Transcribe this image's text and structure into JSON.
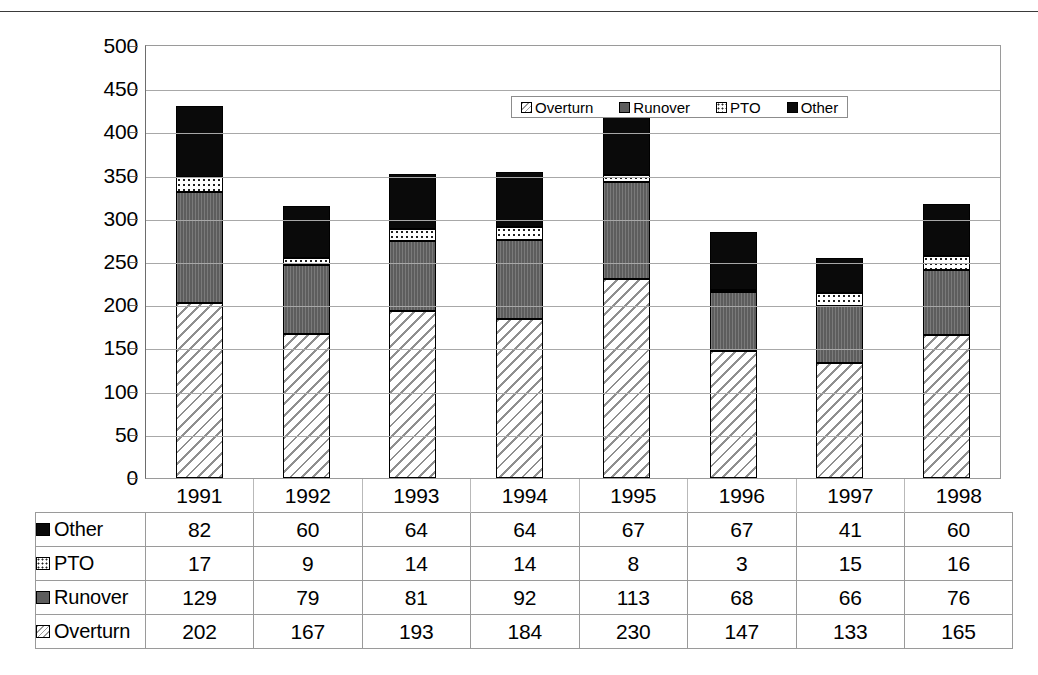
{
  "chart_data": {
    "type": "bar",
    "stacked": true,
    "title": "",
    "xlabel": "",
    "ylabel": "",
    "ylim": [
      0,
      500
    ],
    "ytick_step": 50,
    "yticks": [
      500,
      450,
      400,
      350,
      300,
      250,
      200,
      150,
      100,
      50,
      0
    ],
    "grid": true,
    "legend_position": "top-center",
    "categories": [
      "1991",
      "1992",
      "1993",
      "1994",
      "1995",
      "1996",
      "1997",
      "1998"
    ],
    "series": [
      {
        "name": "Overturn",
        "pattern": "diagonal-hatch",
        "values": [
          202,
          167,
          193,
          184,
          230,
          147,
          133,
          165
        ]
      },
      {
        "name": "Runover",
        "pattern": "solid-gray",
        "values": [
          129,
          79,
          81,
          92,
          113,
          68,
          66,
          76
        ]
      },
      {
        "name": "PTO",
        "pattern": "dotted-white",
        "values": [
          17,
          9,
          14,
          14,
          8,
          3,
          15,
          16
        ]
      },
      {
        "name": "Other",
        "pattern": "solid-black",
        "values": [
          82,
          60,
          64,
          64,
          67,
          67,
          41,
          60
        ]
      }
    ],
    "stack_order_bottom_to_top": [
      "Overturn",
      "Runover",
      "PTO",
      "Other"
    ]
  },
  "legend": {
    "items": [
      {
        "label": "Overturn",
        "swatch": "overturn"
      },
      {
        "label": "Runover",
        "swatch": "runover"
      },
      {
        "label": "PTO",
        "swatch": "pto"
      },
      {
        "label": "Other",
        "swatch": "other"
      }
    ]
  },
  "table": {
    "header": [
      "",
      "1991",
      "1992",
      "1993",
      "1994",
      "1995",
      "1996",
      "1997",
      "1998"
    ],
    "rows": [
      {
        "label": "Other",
        "swatch": "other",
        "values": [
          "82",
          "60",
          "64",
          "64",
          "67",
          "67",
          "41",
          "60"
        ]
      },
      {
        "label": "PTO",
        "swatch": "pto",
        "values": [
          "17",
          "9",
          "14",
          "14",
          "8",
          "3",
          "15",
          "16"
        ]
      },
      {
        "label": "Runover",
        "swatch": "runover",
        "values": [
          "129",
          "79",
          "81",
          "92",
          "113",
          "68",
          "66",
          "76"
        ]
      },
      {
        "label": "Overturn",
        "swatch": "overturn",
        "values": [
          "202",
          "167",
          "193",
          "184",
          "230",
          "147",
          "133",
          "165"
        ]
      }
    ]
  },
  "colors": {
    "other": "#0a0a0a",
    "runover": "#5d5d5d",
    "pto": "#ffffff",
    "overturn": "#ffffff",
    "grid": "#a8a8a8",
    "axis": "#6d6d6d"
  }
}
